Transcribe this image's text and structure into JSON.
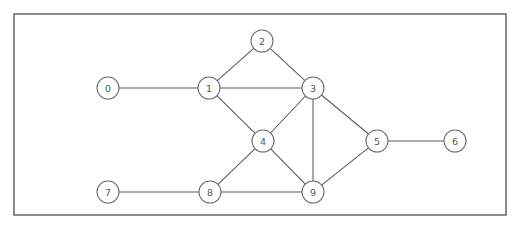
{
  "figure": {
    "kind": "node-link-graph",
    "background_color": "#ffffff",
    "frame": {
      "name": "plot-border",
      "x": 14,
      "y": 14,
      "width": 492,
      "height": 201,
      "stroke_color": "#3f3f46",
      "fill_color": "#ffffff"
    },
    "style": {
      "node_radius": 11,
      "node_fill": "#ffffff",
      "node_stroke": "#6b6b70",
      "edge_stroke": "#5a5a5f",
      "label_color": "#55555a"
    }
  },
  "graph_data": {
    "type": "graph",
    "directed": false,
    "node_count": 10,
    "edge_count": 14,
    "nodes": [
      {
        "id": "0",
        "label": "0",
        "x": 108,
        "y": 88,
        "degree": 1
      },
      {
        "id": "1",
        "label": "1",
        "x": 209,
        "y": 88,
        "degree": 4
      },
      {
        "id": "2",
        "label": "2",
        "x": 262,
        "y": 41,
        "degree": 2
      },
      {
        "id": "3",
        "label": "3",
        "x": 313,
        "y": 88,
        "degree": 5
      },
      {
        "id": "4",
        "label": "4",
        "x": 263,
        "y": 141,
        "degree": 4
      },
      {
        "id": "5",
        "label": "5",
        "x": 377,
        "y": 141,
        "degree": 3
      },
      {
        "id": "6",
        "label": "6",
        "x": 455,
        "y": 141,
        "degree": 1
      },
      {
        "id": "7",
        "label": "7",
        "x": 108,
        "y": 192,
        "degree": 1
      },
      {
        "id": "8",
        "label": "8",
        "x": 210,
        "y": 192,
        "degree": 3
      },
      {
        "id": "9",
        "label": "9",
        "x": 313,
        "y": 192,
        "degree": 4
      }
    ],
    "edges": [
      {
        "source": "0",
        "target": "1"
      },
      {
        "source": "1",
        "target": "2"
      },
      {
        "source": "1",
        "target": "3"
      },
      {
        "source": "1",
        "target": "4"
      },
      {
        "source": "2",
        "target": "3"
      },
      {
        "source": "3",
        "target": "4"
      },
      {
        "source": "3",
        "target": "5"
      },
      {
        "source": "3",
        "target": "9"
      },
      {
        "source": "4",
        "target": "8"
      },
      {
        "source": "4",
        "target": "9"
      },
      {
        "source": "5",
        "target": "6"
      },
      {
        "source": "5",
        "target": "9"
      },
      {
        "source": "7",
        "target": "8"
      },
      {
        "source": "8",
        "target": "9"
      }
    ]
  }
}
